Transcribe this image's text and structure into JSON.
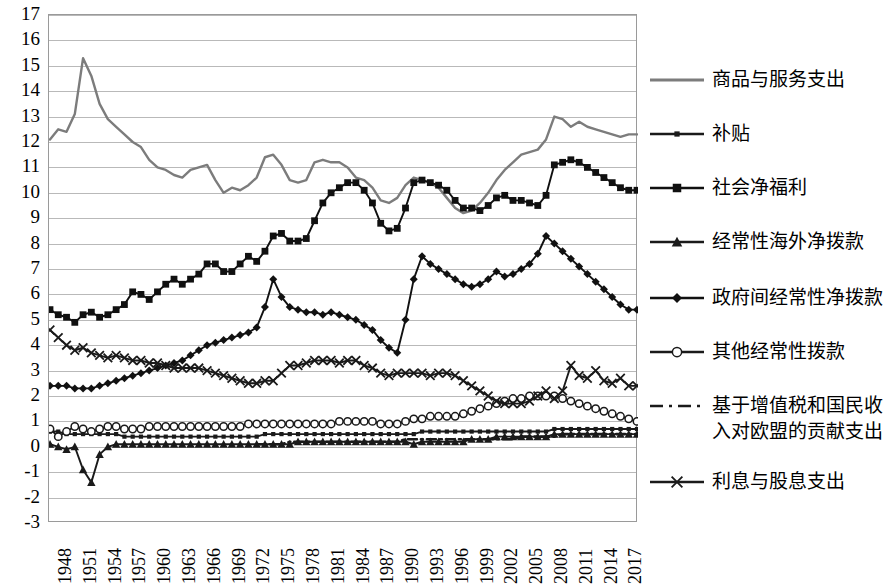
{
  "chart_data": {
    "type": "line",
    "title": "",
    "xlabel": "",
    "ylabel": "",
    "ylim": [
      -3,
      17
    ],
    "ytick_labels": [
      "17",
      "16",
      "15",
      "14",
      "13",
      "12",
      "11",
      "10",
      "9",
      "8",
      "7",
      "6",
      "5",
      "4",
      "3",
      "2",
      "1",
      "0",
      "-1",
      "-2",
      "-3"
    ],
    "grid": true,
    "legend_position": "right",
    "x_start": 1948,
    "x_end": 2019,
    "xtick_labels": [
      "1948",
      "1951",
      "1954",
      "1957",
      "1960",
      "1963",
      "1966",
      "1969",
      "1972",
      "1975",
      "1978",
      "1981",
      "1984",
      "1987",
      "1990",
      "1993",
      "1996",
      "1999",
      "2002",
      "2005",
      "2008",
      "2011",
      "2014",
      "2017"
    ],
    "x": [
      1948,
      1949,
      1950,
      1951,
      1952,
      1953,
      1954,
      1955,
      1956,
      1957,
      1958,
      1959,
      1960,
      1961,
      1962,
      1963,
      1964,
      1965,
      1966,
      1967,
      1968,
      1969,
      1970,
      1971,
      1972,
      1973,
      1974,
      1975,
      1976,
      1977,
      1978,
      1979,
      1980,
      1981,
      1982,
      1983,
      1984,
      1985,
      1986,
      1987,
      1988,
      1989,
      1990,
      1991,
      1992,
      1993,
      1994,
      1995,
      1996,
      1997,
      1998,
      1999,
      2000,
      2001,
      2002,
      2003,
      2004,
      2005,
      2006,
      2007,
      2008,
      2009,
      2010,
      2011,
      2012,
      2013,
      2014,
      2015,
      2016,
      2017,
      2018,
      2019
    ],
    "series": [
      {
        "name": "商品与服务支出",
        "key": "goods_services",
        "marker": "none",
        "color": "#7c7c7c",
        "values": [
          12.1,
          12.5,
          12.4,
          13.1,
          15.3,
          14.6,
          13.5,
          12.9,
          12.6,
          12.3,
          12.0,
          11.8,
          11.3,
          11.0,
          10.9,
          10.7,
          10.6,
          10.9,
          11.0,
          11.1,
          10.5,
          10.0,
          10.2,
          10.1,
          10.3,
          10.6,
          11.4,
          11.5,
          11.1,
          10.5,
          10.4,
          10.5,
          11.2,
          11.3,
          11.2,
          11.2,
          11.0,
          10.6,
          10.5,
          10.2,
          9.7,
          9.6,
          9.8,
          10.3,
          10.6,
          10.5,
          10.4,
          10.2,
          9.8,
          9.4,
          9.2,
          9.3,
          9.6,
          10.0,
          10.5,
          10.9,
          11.2,
          11.5,
          11.6,
          11.7,
          12.1,
          13.0,
          12.9,
          12.6,
          12.8,
          12.6,
          12.5,
          12.4,
          12.3,
          12.2,
          12.3,
          12.3
        ]
      },
      {
        "name": "补贴",
        "key": "subsidies",
        "marker": "small-square",
        "color": "#1a1a1a",
        "values": [
          0.6,
          0.6,
          0.5,
          0.5,
          0.5,
          0.5,
          0.5,
          0.5,
          0.5,
          0.4,
          0.4,
          0.4,
          0.4,
          0.4,
          0.4,
          0.4,
          0.4,
          0.4,
          0.4,
          0.4,
          0.4,
          0.4,
          0.4,
          0.4,
          0.4,
          0.4,
          0.5,
          0.5,
          0.5,
          0.5,
          0.5,
          0.5,
          0.5,
          0.5,
          0.5,
          0.5,
          0.5,
          0.5,
          0.5,
          0.5,
          0.5,
          0.5,
          0.5,
          0.5,
          0.5,
          0.6,
          0.6,
          0.6,
          0.6,
          0.6,
          0.6,
          0.6,
          0.6,
          0.6,
          0.6,
          0.6,
          0.6,
          0.6,
          0.6,
          0.6,
          0.6,
          0.7,
          0.7,
          0.7,
          0.7,
          0.7,
          0.7,
          0.7,
          0.7,
          0.7,
          0.7,
          0.7
        ]
      },
      {
        "name": "社会净福利",
        "key": "net_social_benefits",
        "marker": "square",
        "color": "#101010",
        "values": [
          5.4,
          5.2,
          5.1,
          4.9,
          5.2,
          5.3,
          5.1,
          5.2,
          5.4,
          5.6,
          6.1,
          6.0,
          5.8,
          6.1,
          6.4,
          6.6,
          6.4,
          6.6,
          6.8,
          7.2,
          7.2,
          6.9,
          6.9,
          7.2,
          7.5,
          7.3,
          7.7,
          8.3,
          8.4,
          8.1,
          8.1,
          8.2,
          8.9,
          9.6,
          10.0,
          10.2,
          10.4,
          10.4,
          10.1,
          9.6,
          8.8,
          8.5,
          8.6,
          9.4,
          10.4,
          10.5,
          10.4,
          10.3,
          10.1,
          9.7,
          9.4,
          9.4,
          9.3,
          9.5,
          9.8,
          9.9,
          9.7,
          9.7,
          9.6,
          9.5,
          9.9,
          11.1,
          11.2,
          11.3,
          11.2,
          11.0,
          10.8,
          10.6,
          10.4,
          10.2,
          10.1,
          10.1
        ]
      },
      {
        "name": "经常性海外净拨款",
        "key": "net_current_grants_abroad",
        "marker": "triangle",
        "color": "#1a1a1a",
        "values": [
          0.1,
          0.0,
          -0.1,
          0.0,
          -0.9,
          -1.4,
          -0.3,
          0.0,
          0.1,
          0.1,
          0.1,
          0.1,
          0.1,
          0.1,
          0.1,
          0.1,
          0.1,
          0.1,
          0.1,
          0.1,
          0.1,
          0.1,
          0.1,
          0.1,
          0.1,
          0.1,
          0.1,
          0.1,
          0.1,
          0.1,
          0.2,
          0.2,
          0.2,
          0.2,
          0.2,
          0.2,
          0.2,
          0.2,
          0.2,
          0.2,
          0.2,
          0.2,
          0.2,
          0.2,
          0.1,
          0.2,
          0.2,
          0.2,
          0.2,
          0.2,
          0.2,
          0.3,
          0.3,
          0.3,
          0.4,
          0.4,
          0.4,
          0.4,
          0.4,
          0.4,
          0.4,
          0.5,
          0.5,
          0.5,
          0.5,
          0.5,
          0.5,
          0.5,
          0.5,
          0.5,
          0.5,
          0.5
        ]
      },
      {
        "name": "政府间经常性净拨款",
        "key": "net_current_grants_intergovernment",
        "marker": "diamond",
        "color": "#111111",
        "values": [
          2.4,
          2.4,
          2.4,
          2.3,
          2.3,
          2.3,
          2.4,
          2.5,
          2.6,
          2.7,
          2.8,
          2.9,
          3.0,
          3.1,
          3.2,
          3.3,
          3.4,
          3.6,
          3.8,
          4.0,
          4.1,
          4.2,
          4.3,
          4.4,
          4.5,
          4.7,
          5.5,
          6.6,
          5.9,
          5.5,
          5.4,
          5.3,
          5.3,
          5.2,
          5.3,
          5.2,
          5.1,
          5.0,
          4.8,
          4.6,
          4.2,
          3.9,
          3.7,
          5.0,
          6.6,
          7.5,
          7.2,
          7.0,
          6.8,
          6.6,
          6.4,
          6.3,
          6.4,
          6.6,
          6.9,
          6.7,
          6.8,
          7.0,
          7.2,
          7.6,
          8.3,
          8.0,
          7.7,
          7.4,
          7.1,
          6.8,
          6.5,
          6.2,
          5.9,
          5.6,
          5.4,
          5.4
        ]
      },
      {
        "name": "其他经常性拨款",
        "key": "other_current_grants",
        "marker": "circle",
        "color": "#1a1a1a",
        "values": [
          0.7,
          0.4,
          0.6,
          0.8,
          0.7,
          0.6,
          0.7,
          0.8,
          0.8,
          0.7,
          0.7,
          0.7,
          0.8,
          0.8,
          0.8,
          0.8,
          0.8,
          0.8,
          0.8,
          0.8,
          0.8,
          0.8,
          0.8,
          0.8,
          0.9,
          0.9,
          0.9,
          0.9,
          0.9,
          0.9,
          0.9,
          0.9,
          0.9,
          0.9,
          0.9,
          1.0,
          1.0,
          1.0,
          1.0,
          1.0,
          0.9,
          0.9,
          0.9,
          1.0,
          1.1,
          1.1,
          1.2,
          1.2,
          1.2,
          1.2,
          1.3,
          1.4,
          1.5,
          1.6,
          1.7,
          1.8,
          1.9,
          1.9,
          2.0,
          2.0,
          2.0,
          2.0,
          1.9,
          1.8,
          1.7,
          1.6,
          1.5,
          1.4,
          1.3,
          1.2,
          1.1,
          1.0
        ]
      },
      {
        "name": "基于增值税和国民收入对欧盟的贡献支出",
        "key": "eu_contributions_vat_gni",
        "marker": "dash-dot",
        "color": "#1a1a1a",
        "values": [
          null,
          null,
          null,
          null,
          null,
          null,
          null,
          null,
          null,
          null,
          null,
          null,
          null,
          null,
          null,
          null,
          null,
          null,
          null,
          null,
          null,
          null,
          null,
          null,
          null,
          0.1,
          0.1,
          0.1,
          0.1,
          0.2,
          0.2,
          0.2,
          0.2,
          0.2,
          0.2,
          0.2,
          0.2,
          0.2,
          0.2,
          0.2,
          0.2,
          0.2,
          0.2,
          0.3,
          0.3,
          0.3,
          0.3,
          0.3,
          0.3,
          0.3,
          0.3,
          0.3,
          0.3,
          0.3,
          0.3,
          0.3,
          0.3,
          0.4,
          0.4,
          0.4,
          0.4,
          0.4,
          0.5,
          0.5,
          0.5,
          0.5,
          0.5,
          0.5,
          0.5,
          0.5,
          0.5,
          0.5
        ]
      },
      {
        "name": "利息与股息支出",
        "key": "interest_dividends",
        "marker": "cross",
        "color": "#1a1a1a",
        "values": [
          4.6,
          4.3,
          4.0,
          3.8,
          3.9,
          3.7,
          3.6,
          3.5,
          3.6,
          3.5,
          3.4,
          3.4,
          3.3,
          3.3,
          3.2,
          3.1,
          3.1,
          3.1,
          3.1,
          3.0,
          2.9,
          2.8,
          2.7,
          2.6,
          2.5,
          2.5,
          2.6,
          2.6,
          2.9,
          3.2,
          3.2,
          3.3,
          3.4,
          3.4,
          3.4,
          3.3,
          3.4,
          3.4,
          3.2,
          3.1,
          2.9,
          2.8,
          2.9,
          2.9,
          2.9,
          2.9,
          2.8,
          2.9,
          2.9,
          2.8,
          2.6,
          2.4,
          2.2,
          2.0,
          1.8,
          1.7,
          1.7,
          1.7,
          1.8,
          2.0,
          2.2,
          1.9,
          2.2,
          3.2,
          2.8,
          2.7,
          3.0,
          2.6,
          2.5,
          2.7,
          2.4,
          2.4
        ]
      }
    ]
  },
  "legend": {
    "items": [
      {
        "label": "商品与服务支出",
        "key": "goods_services",
        "marker": "none"
      },
      {
        "label": "补贴",
        "key": "subsidies",
        "marker": "small-square"
      },
      {
        "label": "社会净福利",
        "key": "net_social_benefits",
        "marker": "square"
      },
      {
        "label": "经常性海外净拨款",
        "key": "net_current_grants_abroad",
        "marker": "triangle"
      },
      {
        "label": "政府间经常性净拨款",
        "key": "net_current_grants_intergovernment",
        "marker": "diamond"
      },
      {
        "label": "其他经常性拨款",
        "key": "other_current_grants",
        "marker": "circle"
      },
      {
        "label": "基于增值税和国民收\n入对欧盟的贡献支出",
        "key": "eu_contributions_vat_gni",
        "marker": "dash-dot"
      },
      {
        "label": "利息与股息支出",
        "key": "interest_dividends",
        "marker": "cross"
      }
    ]
  }
}
